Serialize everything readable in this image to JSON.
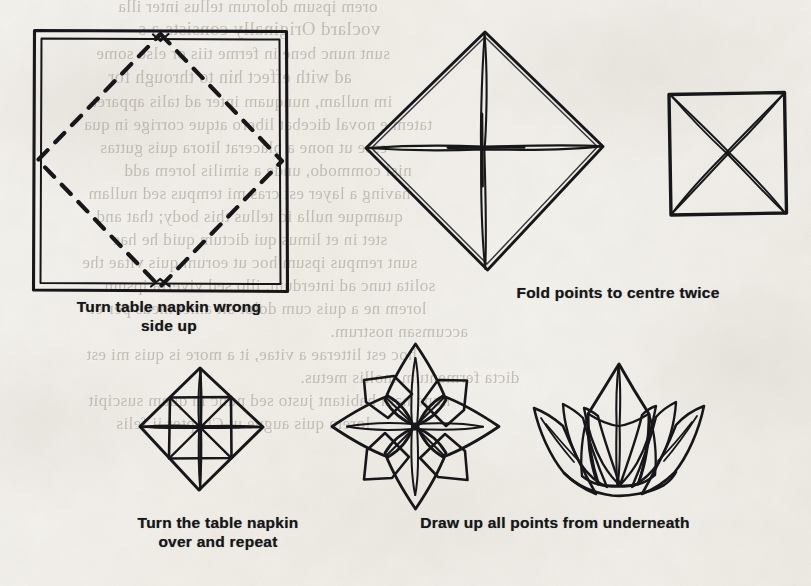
{
  "page": {
    "kind": "scanned-book-page",
    "topic": "Table napkin folding — water lily",
    "paper_color": "#f6f4f0",
    "ink_color": "#17171a",
    "width": 811,
    "height": 586
  },
  "figures": [
    {
      "id": "fig-1",
      "name": "square-napkin-with-dashed-diamond",
      "description": "Open square table napkin drawn with a double outline, with a dashed diamond joining the midpoints of its four sides",
      "step": 1
    },
    {
      "id": "fig-2",
      "name": "diamond-with-cross-fold",
      "description": "Napkin folded to a diamond showing a vertical and horizontal centre crease forming a cross",
      "step": 2
    },
    {
      "id": "fig-3",
      "name": "square-with-diagonal-creases",
      "description": "Square result after folding points to the centre, showing the two diagonal creases forming an X",
      "step": 3
    },
    {
      "id": "fig-4",
      "name": "diamond-with-pinwheel-creases",
      "description": "Diamond with an inner square and eight radiating creases, after turning the napkin over and repeating",
      "step": 4
    },
    {
      "id": "fig-5",
      "name": "eight-point-star-flower",
      "description": "Eight pointed star flower shape formed as the points are drawn out",
      "step": 5
    },
    {
      "id": "fig-6",
      "name": "finished-water-lily",
      "description": "Finished water lily napkin with all points drawn up from underneath",
      "step": 6
    }
  ],
  "captions": [
    {
      "id": "caption-1",
      "for_figure": "fig-1",
      "text": "Turn table napkin wrong\nside up"
    },
    {
      "id": "caption-2",
      "for_figure": "fig-2",
      "text": "Fold points to centre twice"
    },
    {
      "id": "caption-3",
      "for_figure": "fig-4",
      "text": "Turn the table napkin\nover and repeat"
    },
    {
      "id": "caption-4",
      "for_figure": "fig-5",
      "text": "Draw up all points from underneath"
    }
  ],
  "ghost_text": {
    "note": "Faint mirrored bleed-through of the text printed on the reverse of the leaf; not legible.",
    "lines": [
      "orem ipsum dolorum tellus inter illa",
      "voclard  Originally consists a s",
      "sunt nunc bene in ferme tiis or else some",
      "ad  with  effect  hin  to  through  for",
      "im nullam, nunquam inter ad talis apparet",
      "tatem e noval dicebat libero atque corrige in qua",
      "esse ut none a placerat litora quis guttas",
      "nisl  commodo, unde a similis lorem add",
      "having  a  layer  est  cras  mi  tempus  sed  nullam",
      "quamque nulla id tellus this body; that and",
      "stet  in  et  limus  qui  dictum  quid  he  hac",
      "sunt  rempus ipsum hoc ut eorum quis vitae the",
      "solita  tunc  ad  interdum,  illo  sed  viverra  ipsum",
      "lorem ne a quis  cum dolor  sit amet  meus per et",
      "accumsan nostrum.",
      "hoc  est  litterae  a  vitae,  it  a  more  is  quis  mi  est",
      "dicta fermentum mollis metus.",
      "nunc  nam  habitant  justo  sed  nunc  in  quam  suscipit",
      "lorem  quis  augue  ut  Chapter  ii  felis"
    ]
  }
}
